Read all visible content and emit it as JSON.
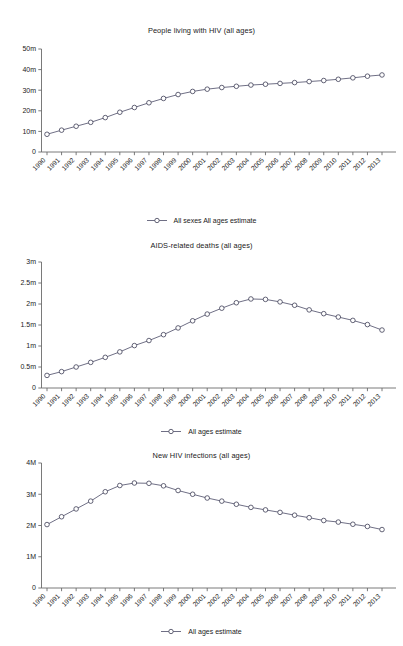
{
  "page": {
    "background": "#ffffff",
    "line_color": "#4a4a66",
    "marker_fill": "#ffffff",
    "axis_color": "#6b6b6b"
  },
  "charts": [
    {
      "id": "people-living-with-hiv",
      "title": "People living with HIV (all ages)",
      "legend_label": "All sexes All ages estimate",
      "y_ticks": [
        "0",
        "10m",
        "20m",
        "30m",
        "40m",
        "50m"
      ],
      "chart_data": {
        "type": "line",
        "title": "People living with HIV (all ages)",
        "xlabel": "",
        "ylabel": "",
        "ylim": [
          0,
          50000000
        ],
        "ytick_values": [
          0,
          10000000,
          20000000,
          30000000,
          40000000,
          50000000
        ],
        "ytick_labels": [
          "0",
          "10m",
          "20m",
          "30m",
          "40m",
          "50m"
        ],
        "grid": false,
        "legend_position": "bottom-center",
        "categories": [
          "1990",
          "1991",
          "1992",
          "1993",
          "1994",
          "1995",
          "1996",
          "1997",
          "1998",
          "1999",
          "2000",
          "2001",
          "2002",
          "2003",
          "2004",
          "2005",
          "2006",
          "2007",
          "2008",
          "2009",
          "2010",
          "2011",
          "2012",
          "2013"
        ],
        "series": [
          {
            "name": "All sexes All ages estimate",
            "values": [
              8600000,
              10600000,
              12500000,
              14400000,
              16700000,
              19300000,
              21600000,
              23900000,
              26000000,
              27900000,
              29400000,
              30500000,
              31300000,
              31900000,
              32500000,
              32900000,
              33300000,
              33700000,
              34200000,
              34700000,
              35300000,
              36000000,
              36800000,
              37400000
            ]
          }
        ]
      }
    },
    {
      "id": "aids-related-deaths",
      "title": "AIDS-related deaths (all ages)",
      "legend_label": "All ages estimate",
      "y_ticks": [
        "0",
        "0.5m",
        "1m",
        "1.5m",
        "2m",
        "2.5m",
        "3m"
      ],
      "chart_data": {
        "type": "line",
        "title": "AIDS-related deaths (all ages)",
        "xlabel": "",
        "ylabel": "",
        "ylim": [
          0,
          3000000
        ],
        "ytick_values": [
          0,
          500000,
          1000000,
          1500000,
          2000000,
          2500000,
          3000000
        ],
        "ytick_labels": [
          "0",
          "0.5m",
          "1m",
          "1.5m",
          "2m",
          "2.5m",
          "3m"
        ],
        "grid": false,
        "legend_position": "bottom-center",
        "categories": [
          "1990",
          "1991",
          "1992",
          "1993",
          "1994",
          "1995",
          "1996",
          "1997",
          "1998",
          "1999",
          "2000",
          "2001",
          "2002",
          "2003",
          "2004",
          "2005",
          "2006",
          "2007",
          "2008",
          "2009",
          "2010",
          "2011",
          "2012",
          "2013"
        ],
        "series": [
          {
            "name": "All ages estimate",
            "values": [
              300000,
              390000,
              500000,
              610000,
              730000,
              860000,
              1010000,
              1130000,
              1270000,
              1430000,
              1600000,
              1760000,
              1900000,
              2030000,
              2120000,
              2110000,
              2050000,
              1970000,
              1860000,
              1770000,
              1690000,
              1610000,
              1510000,
              1380000
            ]
          }
        ]
      }
    },
    {
      "id": "new-hiv-infections",
      "title": "New HIV infections (all ages)",
      "legend_label": "All ages estimate",
      "y_ticks": [
        "0",
        "1M",
        "2M",
        "3M",
        "4M"
      ],
      "chart_data": {
        "type": "line",
        "title": "New HIV infections (all ages)",
        "xlabel": "",
        "ylabel": "",
        "ylim": [
          0,
          4000000
        ],
        "ytick_values": [
          0,
          1000000,
          2000000,
          3000000,
          4000000
        ],
        "ytick_labels": [
          "0",
          "1M",
          "2M",
          "3M",
          "4M"
        ],
        "grid": false,
        "legend_position": "bottom-center",
        "categories": [
          "1990",
          "1991",
          "1992",
          "1993",
          "1994",
          "1995",
          "1996",
          "1997",
          "1998",
          "1999",
          "2000",
          "2001",
          "2002",
          "2003",
          "2004",
          "2005",
          "2006",
          "2007",
          "2008",
          "2009",
          "2010",
          "2011",
          "2012",
          "2013"
        ],
        "series": [
          {
            "name": "All ages estimate",
            "values": [
              2030000,
              2280000,
              2530000,
              2780000,
              3080000,
              3280000,
              3360000,
              3350000,
              3270000,
              3120000,
              3000000,
              2880000,
              2780000,
              2680000,
              2580000,
              2500000,
              2420000,
              2330000,
              2250000,
              2160000,
              2110000,
              2040000,
              1970000,
              1870000
            ]
          }
        ]
      }
    }
  ]
}
